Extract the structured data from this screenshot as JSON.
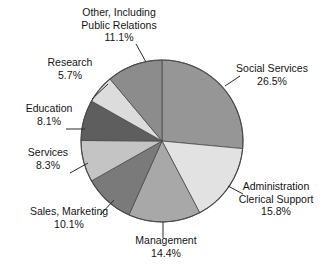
{
  "chart_data": {
    "type": "pie",
    "title": "",
    "subtitle": "",
    "xlabel": "",
    "ylabel": "",
    "legend_position": "none",
    "grid": false,
    "units": "percent",
    "start_angle_deg": 0,
    "direction": "clockwise",
    "categories": [
      "Social Services",
      "Administration Clerical Support",
      "Management",
      "Sales, Marketing",
      "Services",
      "Education",
      "Research",
      "Other, Including Public Relations"
    ],
    "values": [
      26.5,
      15.8,
      14.4,
      10.1,
      8.3,
      8.1,
      5.7,
      11.1
    ],
    "slices": [
      {
        "label": "Social Services",
        "value": 26.5,
        "value_text": "26.5%",
        "color": "#969696"
      },
      {
        "label": "Administration Clerical Support",
        "value": 15.8,
        "value_text": "15.8%",
        "color": "#e2e2e2"
      },
      {
        "label": "Management",
        "value": 14.4,
        "value_text": "14.4%",
        "color": "#a8a8a8"
      },
      {
        "label": "Sales, Marketing",
        "value": 10.1,
        "value_text": "10.1%",
        "color": "#7a7a7a"
      },
      {
        "label": "Services",
        "value": 8.3,
        "value_text": "8.3%",
        "color": "#c4c4c4"
      },
      {
        "label": "Education",
        "value": 8.1,
        "value_text": "8.1%",
        "color": "#5e5e5e"
      },
      {
        "label": "Research",
        "value": 5.7,
        "value_text": "5.7%",
        "color": "#dcdcdc"
      },
      {
        "label": "Other, Including Public Relations",
        "value": 11.1,
        "value_text": "11.1%",
        "color": "#8c8c8c"
      }
    ]
  },
  "labels": {
    "other": {
      "line1": "Other, Including",
      "line2": "Public Relations",
      "pct": "11.1%"
    },
    "research": {
      "line1": "Research",
      "pct": "5.7%"
    },
    "education": {
      "line1": "Education",
      "pct": "8.1%"
    },
    "services": {
      "line1": "Services",
      "pct": "8.3%"
    },
    "sales": {
      "line1": "Sales, Marketing",
      "pct": "10.1%"
    },
    "management": {
      "line1": "Management",
      "pct": "14.4%"
    },
    "social": {
      "line1": "Social Services",
      "pct": "26.5%"
    },
    "admin": {
      "line1": "Administration",
      "line2": "Clerical Support",
      "pct": "15.8%"
    }
  },
  "style": {
    "outline_color": "#4a4a4a",
    "leader_color": "#2b2b2b",
    "text_color": "#141414",
    "background": "#ffffff"
  }
}
